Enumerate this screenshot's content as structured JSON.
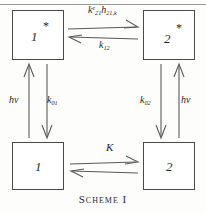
{
  "figure": {
    "caption": "Scheme I",
    "top_rule": true
  },
  "boxes": [
    {
      "id": "excited-1",
      "label": "1",
      "star": "*",
      "has_star": true
    },
    {
      "id": "excited-2",
      "label": "2",
      "star": "*",
      "has_star": true
    },
    {
      "id": "ground-1",
      "label": "1",
      "star": "",
      "has_star": false
    },
    {
      "id": "ground-2",
      "label": "2",
      "star": "",
      "has_star": false
    }
  ],
  "rates": {
    "top_forward": {
      "text": "k²₂₁h₂₁,ₖ",
      "base1": "k",
      "sup1": "e",
      "sub1": "21",
      "base2": "h",
      "sub2": "21,k",
      "direction": "right"
    },
    "top_reverse": {
      "text": "k₁₂",
      "base": "k",
      "sub": "12",
      "direction": "left"
    },
    "bottom_forward": {
      "text": "K",
      "base": "K",
      "sub": "",
      "direction": "right"
    },
    "bottom_reverse": {
      "text": "",
      "base": "",
      "sub": "",
      "direction": "left"
    },
    "left_up": {
      "text": "hν",
      "base": "hν",
      "direction": "up"
    },
    "left_down": {
      "base": "k",
      "sub": "01",
      "direction": "down"
    },
    "right_down": {
      "base": "k",
      "sub": "02",
      "direction": "down"
    },
    "right_up": {
      "text": "hν",
      "base": "hν",
      "direction": "up"
    }
  },
  "colors": {
    "stroke": "#5a5a5a",
    "box_border": "#4a4a4a",
    "text": "#262626",
    "background": "#fdfdfc"
  }
}
